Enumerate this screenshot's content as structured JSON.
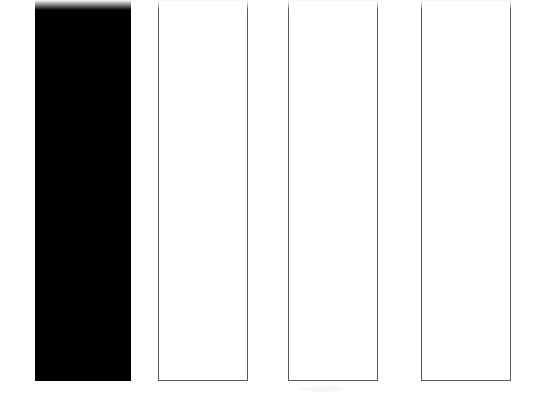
{
  "chart_data": {
    "type": "bar",
    "title": "",
    "subtitle": "",
    "xlabel": "",
    "ylabel": "",
    "categories": [
      "",
      "",
      "",
      ""
    ],
    "values": [
      100,
      100,
      100,
      100
    ],
    "ylim": [
      0,
      100
    ],
    "grid": false,
    "legend": null,
    "legend_position": "none",
    "annotations": [],
    "tick_labels": {
      "x": [],
      "y": []
    },
    "bars": [
      {
        "index": 1,
        "label": "",
        "fill": "#000000",
        "edge": "#000000",
        "style": "filled",
        "left_px": 35,
        "right_px": 131,
        "top_px": 0,
        "bottom_px": 381,
        "clipped_top": true
      },
      {
        "index": 2,
        "label": "",
        "fill": "#ffffff",
        "edge": "#5a5a5a",
        "style": "outlined",
        "left_px": 158,
        "right_px": 248,
        "top_px": 0,
        "bottom_px": 381,
        "clipped_top": true
      },
      {
        "index": 3,
        "label": "",
        "fill": "#ffffff",
        "edge": "#5a5a5a",
        "style": "outlined",
        "left_px": 288,
        "right_px": 378,
        "top_px": 0,
        "bottom_px": 381,
        "clipped_top": true
      },
      {
        "index": 4,
        "label": "",
        "fill": "#ffffff",
        "edge": "#5a5a5a",
        "style": "outlined",
        "left_px": 421,
        "right_px": 511,
        "top_px": 0,
        "bottom_px": 381,
        "clipped_top": true
      }
    ]
  },
  "figure": {
    "background": "#ffffff",
    "width": 548,
    "height": 397
  }
}
